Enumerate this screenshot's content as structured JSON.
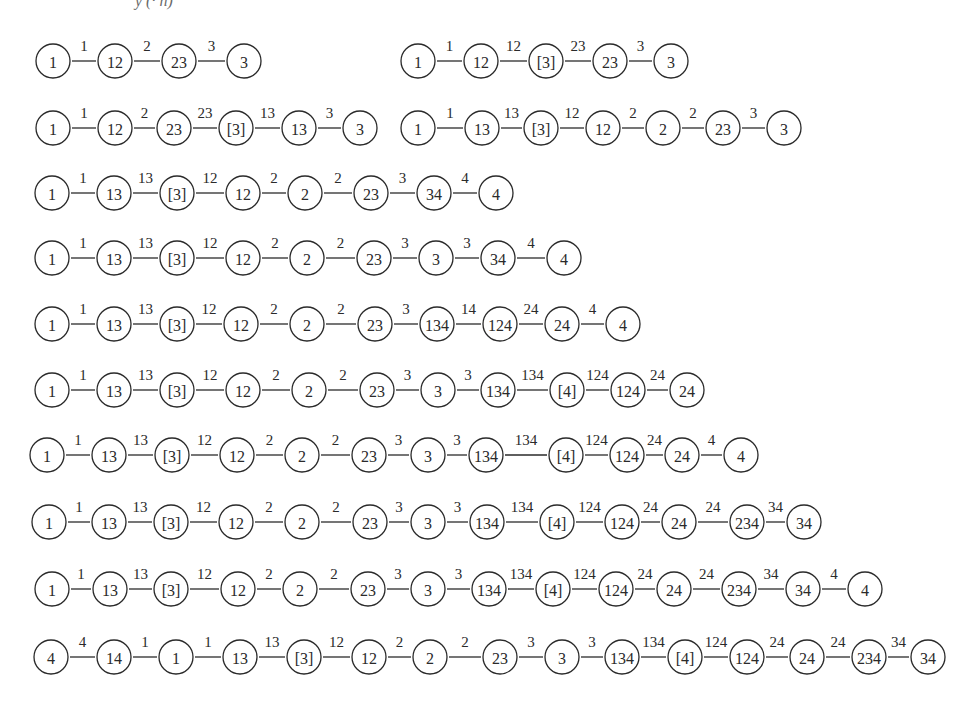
{
  "header": {
    "fragment": "y (· n)"
  },
  "style": {
    "stroke": "#2a2a2a",
    "background": "#ffffff",
    "node_radius": 17
  },
  "chains": [
    {
      "id": "chain-1a",
      "y": 61,
      "nodes": [
        {
          "label": "1",
          "x": 53
        },
        {
          "label": "12",
          "x": 115
        },
        {
          "label": "23",
          "x": 179
        },
        {
          "label": "3",
          "x": 244
        }
      ],
      "edges": [
        "1",
        "2",
        "3"
      ]
    },
    {
      "id": "chain-1b",
      "y": 61,
      "nodes": [
        {
          "label": "1",
          "x": 418
        },
        {
          "label": "12",
          "x": 481
        },
        {
          "label": "[3]",
          "x": 546
        },
        {
          "label": "23",
          "x": 610
        },
        {
          "label": "3",
          "x": 671
        }
      ],
      "edges": [
        "1",
        "12",
        "23",
        "3"
      ]
    },
    {
      "id": "chain-2a",
      "y": 128,
      "nodes": [
        {
          "label": "1",
          "x": 53
        },
        {
          "label": "12",
          "x": 115
        },
        {
          "label": "23",
          "x": 174
        },
        {
          "label": "[3]",
          "x": 236
        },
        {
          "label": "13",
          "x": 299
        },
        {
          "label": "3",
          "x": 360
        }
      ],
      "edges": [
        "1",
        "2",
        "23",
        "13",
        "3"
      ]
    },
    {
      "id": "chain-2b",
      "y": 128,
      "nodes": [
        {
          "label": "1",
          "x": 418
        },
        {
          "label": "13",
          "x": 482
        },
        {
          "label": "[3]",
          "x": 541
        },
        {
          "label": "12",
          "x": 603
        },
        {
          "label": "2",
          "x": 663
        },
        {
          "label": "23",
          "x": 723
        },
        {
          "label": "3",
          "x": 784
        }
      ],
      "edges": [
        "1",
        "13",
        "12",
        "2",
        "2",
        "3"
      ]
    },
    {
      "id": "chain-3",
      "y": 193,
      "nodes": [
        {
          "label": "1",
          "x": 52
        },
        {
          "label": "13",
          "x": 114
        },
        {
          "label": "[3]",
          "x": 177
        },
        {
          "label": "12",
          "x": 243
        },
        {
          "label": "2",
          "x": 305
        },
        {
          "label": "23",
          "x": 371
        },
        {
          "label": "34",
          "x": 434
        },
        {
          "label": "4",
          "x": 496
        }
      ],
      "edges": [
        "1",
        "13",
        "12",
        "2",
        "2",
        "3",
        "4"
      ]
    },
    {
      "id": "chain-4",
      "y": 258,
      "nodes": [
        {
          "label": "1",
          "x": 52
        },
        {
          "label": "13",
          "x": 114
        },
        {
          "label": "[3]",
          "x": 177
        },
        {
          "label": "12",
          "x": 243
        },
        {
          "label": "2",
          "x": 307
        },
        {
          "label": "23",
          "x": 374
        },
        {
          "label": "3",
          "x": 436
        },
        {
          "label": "34",
          "x": 498
        },
        {
          "label": "4",
          "x": 564
        }
      ],
      "edges": [
        "1",
        "13",
        "12",
        "2",
        "2",
        "3",
        "3",
        "4"
      ]
    },
    {
      "id": "chain-5",
      "y": 324,
      "nodes": [
        {
          "label": "1",
          "x": 52
        },
        {
          "label": "13",
          "x": 114
        },
        {
          "label": "[3]",
          "x": 177
        },
        {
          "label": "12",
          "x": 241
        },
        {
          "label": "2",
          "x": 307
        },
        {
          "label": "23",
          "x": 375
        },
        {
          "label": "134",
          "x": 437
        },
        {
          "label": "124",
          "x": 500
        },
        {
          "label": "24",
          "x": 562
        },
        {
          "label": "4",
          "x": 623
        }
      ],
      "edges": [
        "1",
        "13",
        "12",
        "2",
        "2",
        "3",
        "14",
        "24",
        "4"
      ]
    },
    {
      "id": "chain-6",
      "y": 390,
      "nodes": [
        {
          "label": "1",
          "x": 52
        },
        {
          "label": "13",
          "x": 114
        },
        {
          "label": "[3]",
          "x": 177
        },
        {
          "label": "12",
          "x": 243
        },
        {
          "label": "2",
          "x": 309
        },
        {
          "label": "23",
          "x": 377
        },
        {
          "label": "3",
          "x": 438
        },
        {
          "label": "134",
          "x": 498
        },
        {
          "label": "[4]",
          "x": 567
        },
        {
          "label": "124",
          "x": 628
        },
        {
          "label": "24",
          "x": 687
        }
      ],
      "edges": [
        "1",
        "13",
        "12",
        "2",
        "2",
        "3",
        "3",
        "134",
        "124",
        "24"
      ]
    },
    {
      "id": "chain-7",
      "y": 455,
      "nodes": [
        {
          "label": "1",
          "x": 47
        },
        {
          "label": "13",
          "x": 109
        },
        {
          "label": "[3]",
          "x": 172
        },
        {
          "label": "12",
          "x": 237
        },
        {
          "label": "2",
          "x": 302
        },
        {
          "label": "23",
          "x": 369
        },
        {
          "label": "3",
          "x": 428
        },
        {
          "label": "134",
          "x": 486
        },
        {
          "label": "[4]",
          "x": 566
        },
        {
          "label": "124",
          "x": 627
        },
        {
          "label": "24",
          "x": 682
        },
        {
          "label": "4",
          "x": 741
        }
      ],
      "edges": [
        "1",
        "13",
        "12",
        "2",
        "2",
        "3",
        "3",
        "134",
        "124",
        "24",
        "4"
      ]
    },
    {
      "id": "chain-8",
      "y": 522,
      "nodes": [
        {
          "label": "1",
          "x": 49
        },
        {
          "label": "13",
          "x": 109
        },
        {
          "label": "[3]",
          "x": 171
        },
        {
          "label": "12",
          "x": 236
        },
        {
          "label": "2",
          "x": 302
        },
        {
          "label": "23",
          "x": 370
        },
        {
          "label": "3",
          "x": 428
        },
        {
          "label": "134",
          "x": 487
        },
        {
          "label": "[4]",
          "x": 557
        },
        {
          "label": "124",
          "x": 622
        },
        {
          "label": "24",
          "x": 679
        },
        {
          "label": "234",
          "x": 747
        },
        {
          "label": "34",
          "x": 804
        }
      ],
      "edges": [
        "1",
        "13",
        "12",
        "2",
        "2",
        "3",
        "3",
        "134",
        "124",
        "24",
        "24",
        "34"
      ]
    },
    {
      "id": "chain-9",
      "y": 589,
      "nodes": [
        {
          "label": "1",
          "x": 52
        },
        {
          "label": "13",
          "x": 110
        },
        {
          "label": "[3]",
          "x": 171
        },
        {
          "label": "12",
          "x": 238
        },
        {
          "label": "2",
          "x": 300
        },
        {
          "label": "23",
          "x": 368
        },
        {
          "label": "3",
          "x": 428
        },
        {
          "label": "134",
          "x": 489
        },
        {
          "label": "[4]",
          "x": 553
        },
        {
          "label": "124",
          "x": 616
        },
        {
          "label": "24",
          "x": 674
        },
        {
          "label": "234",
          "x": 739
        },
        {
          "label": "34",
          "x": 803
        },
        {
          "label": "4",
          "x": 865
        }
      ],
      "edges": [
        "1",
        "13",
        "12",
        "2",
        "2",
        "3",
        "3",
        "134",
        "124",
        "24",
        "24",
        "34",
        "4"
      ]
    },
    {
      "id": "chain-10",
      "y": 657,
      "nodes": [
        {
          "label": "4",
          "x": 51
        },
        {
          "label": "14",
          "x": 114
        },
        {
          "label": "1",
          "x": 176
        },
        {
          "label": "13",
          "x": 240
        },
        {
          "label": "[3]",
          "x": 304
        },
        {
          "label": "12",
          "x": 369
        },
        {
          "label": "2",
          "x": 430
        },
        {
          "label": "23",
          "x": 500
        },
        {
          "label": "3",
          "x": 562
        },
        {
          "label": "134",
          "x": 622
        },
        {
          "label": "[4]",
          "x": 685
        },
        {
          "label": "124",
          "x": 747
        },
        {
          "label": "24",
          "x": 807
        },
        {
          "label": "234",
          "x": 869
        },
        {
          "label": "34",
          "x": 928
        }
      ],
      "edges": [
        "4",
        "1",
        "1",
        "13",
        "12",
        "2",
        "2",
        "3",
        "3",
        "134",
        "124",
        "24",
        "24",
        "34"
      ]
    }
  ]
}
